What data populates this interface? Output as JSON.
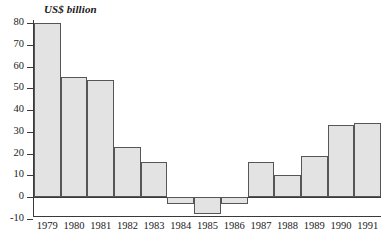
{
  "chart_data": {
    "type": "bar",
    "title": "US$ billion",
    "xlabel": "",
    "ylabel": "US$ billion",
    "ylim": [
      -10,
      80
    ],
    "grid": false,
    "legend": null,
    "ytick_labels": [
      "80",
      "70",
      "60",
      "50",
      "40",
      "30",
      "20",
      "10",
      "0",
      "-10"
    ],
    "ytick_values": [
      80,
      70,
      60,
      50,
      40,
      30,
      20,
      10,
      0,
      -10
    ],
    "categories": [
      "1979",
      "1980",
      "1981",
      "1982",
      "1983",
      "1984",
      "1985",
      "1986",
      "1987",
      "1988",
      "1989",
      "1990",
      "1991"
    ],
    "values": [
      80,
      55,
      54,
      23,
      16,
      -3,
      -8,
      -3,
      16,
      10,
      19,
      33,
      34
    ],
    "colors": {
      "bar_fill": "#e3e3e3",
      "bar_stroke": "#565656",
      "axis": "#3a3a3a",
      "text": "#1a1a1a",
      "background": "#ffffff"
    }
  }
}
